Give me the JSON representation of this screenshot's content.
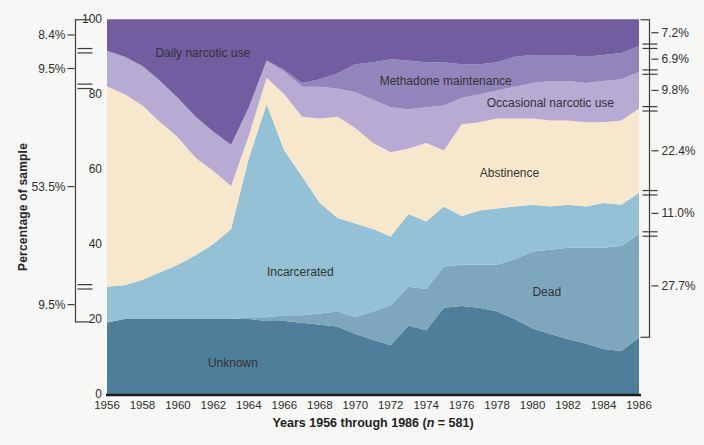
{
  "figure": {
    "y_axis_title": "Percentage of sample",
    "x_axis_title_prefix": "Years 1956 through 1986 (",
    "x_axis_title_n": "n",
    "x_axis_title_suffix": " = 581)"
  },
  "chart_data": {
    "type": "area",
    "stacked": true,
    "title": "",
    "xlabel": "Years 1956 through 1986 (n = 581)",
    "ylabel": "Percentage of sample",
    "xlim": [
      1956,
      1986
    ],
    "ylim": [
      0,
      100
    ],
    "grid": false,
    "x": [
      1956,
      1957,
      1958,
      1959,
      1960,
      1961,
      1962,
      1963,
      1964,
      1965,
      1966,
      1967,
      1968,
      1969,
      1970,
      1971,
      1972,
      1973,
      1974,
      1975,
      1976,
      1977,
      1978,
      1979,
      1980,
      1981,
      1982,
      1983,
      1984,
      1985,
      1986
    ],
    "x_ticks": [
      1956,
      1958,
      1960,
      1962,
      1964,
      1966,
      1968,
      1970,
      1972,
      1974,
      1976,
      1978,
      1980,
      1982,
      1984,
      1986
    ],
    "y_ticks": [
      0,
      20,
      40,
      60,
      80,
      100
    ],
    "series": [
      {
        "name": "Unknown",
        "color": "#4e7e99",
        "values": [
          19.1,
          20,
          20,
          20,
          20,
          20,
          20,
          20,
          20,
          19.5,
          19.5,
          19,
          18.5,
          18,
          16,
          14.5,
          13,
          18.3,
          17,
          23,
          23.5,
          23,
          22,
          20,
          17.5,
          16,
          14.7,
          13.5,
          12,
          11.5,
          15.0
        ]
      },
      {
        "name": "Dead",
        "color": "#7ea6bd",
        "values": [
          0,
          0,
          0,
          0,
          0,
          0,
          0,
          0,
          0.5,
          1,
          1.5,
          2,
          3,
          4,
          4.5,
          7.5,
          10.7,
          10.3,
          11,
          11,
          11,
          11.5,
          12.5,
          16,
          20.5,
          22.5,
          24.3,
          25.5,
          27,
          28,
          27.7
        ]
      },
      {
        "name": "Incarcerated",
        "color": "#94c1d5",
        "values": [
          9.5,
          9,
          10.5,
          12.5,
          14.5,
          17,
          20,
          24,
          42.5,
          56.8,
          44,
          37,
          29.5,
          25,
          25,
          22,
          18.3,
          19.4,
          18,
          16,
          13,
          14.5,
          15,
          14,
          12.5,
          11.5,
          11.5,
          11,
          12,
          11,
          11.0
        ]
      },
      {
        "name": "Abstinence",
        "color": "#f7e8cd",
        "values": [
          53.5,
          51,
          46.5,
          40,
          34,
          26,
          19.5,
          11.5,
          6,
          7.1,
          15,
          16,
          22.5,
          27,
          25.5,
          23,
          22.5,
          17.5,
          21,
          15,
          24.5,
          23.5,
          24,
          23.5,
          23,
          23,
          22.5,
          22.5,
          21.5,
          22.5,
          22.4
        ]
      },
      {
        "name": "Occasional narcotic use",
        "color": "#b7aad3",
        "values": [
          9.5,
          10,
          10.5,
          11,
          10.5,
          11,
          10.5,
          11,
          7.5,
          4.6,
          6,
          8,
          8.5,
          7.5,
          9.5,
          11.5,
          12,
          10.5,
          9.5,
          12,
          7,
          7.5,
          7.5,
          8.5,
          9.5,
          10.5,
          10.5,
          10.5,
          11,
          11,
          9.8
        ]
      },
      {
        "name": "Methadone maintenance",
        "color": "#9285bb",
        "values": [
          0,
          0,
          0,
          0,
          0,
          0,
          0,
          0,
          0,
          0,
          0.5,
          1,
          2,
          4,
          7.5,
          10,
          12.8,
          13,
          12,
          11.5,
          9,
          8,
          7.5,
          8,
          7.5,
          7,
          7,
          7,
          7,
          7,
          6.9
        ]
      },
      {
        "name": "Daily narcotic use",
        "color": "#725da0",
        "values": [
          8.4,
          10,
          12.5,
          16.5,
          21,
          26,
          30,
          33.5,
          23.5,
          11,
          13.5,
          17,
          16,
          14.5,
          12,
          11.5,
          10.7,
          11,
          11.5,
          11.5,
          12,
          12,
          11.5,
          10,
          9.5,
          9.5,
          9.5,
          10,
          9.5,
          9,
          7.2
        ]
      }
    ],
    "annotations": [
      {
        "text": "Daily narcotic use",
        "year": 1961.4,
        "value": 90.9
      },
      {
        "text": "Methadone maintenance",
        "year": 1975.1,
        "value": 83.5
      },
      {
        "text": "Occasional narcotic use",
        "year": 1981.0,
        "value": 77.6
      },
      {
        "text": "Abstinence",
        "year": 1978.7,
        "value": 58.9
      },
      {
        "text": "Incarcerated",
        "year": 1966.9,
        "value": 32.5
      },
      {
        "text": "Dead",
        "year": 1980.8,
        "value": 27.2
      },
      {
        "text": "Unknown",
        "year": 1963.1,
        "value": 8.3
      }
    ],
    "left_brackets": [
      {
        "label": "8.4%",
        "from": 91.6,
        "to": 100
      },
      {
        "label": "9.5%",
        "from": 82.1,
        "to": 91.6
      },
      {
        "label": "53.5%",
        "from": 28.6,
        "to": 82.1
      },
      {
        "label": "9.5%",
        "from": 19.1,
        "to": 28.6
      }
    ],
    "right_brackets": [
      {
        "label": "7.2%",
        "from": 92.8,
        "to": 100
      },
      {
        "label": "6.9%",
        "from": 85.9,
        "to": 92.8
      },
      {
        "label": "9.8%",
        "from": 76.1,
        "to": 85.9
      },
      {
        "label": "22.4%",
        "from": 53.7,
        "to": 76.1
      },
      {
        "label": "11.0%",
        "from": 42.7,
        "to": 53.7
      },
      {
        "label": "27.7%",
        "from": 15.0,
        "to": 42.7
      }
    ]
  },
  "colors": {
    "background": "#f7f8f5",
    "text": "#2e2e2e",
    "axis_line": "#1c1c1c",
    "bracket_line": "#3d3d3d"
  }
}
